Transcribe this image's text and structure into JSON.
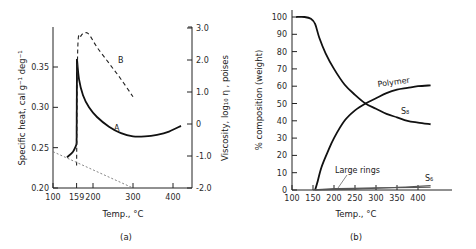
{
  "chart_data": [
    {
      "id": "a",
      "type": "line",
      "panel_label": "(a)",
      "xlabel": "Temp., °C",
      "ylabel_left": "Specific heat,  cal g⁻¹ deg⁻¹",
      "ylabel_right": "Viscosity,  log₁₀ η , poises",
      "xlim": [
        100,
        420
      ],
      "x_ticks": [
        100,
        159,
        200,
        300,
        400
      ],
      "ylim_left": [
        0.2,
        0.39
      ],
      "y_ticks_left": [
        "0.20",
        "0.25",
        "0.30",
        "0.35"
      ],
      "ylim_right": [
        -2.0,
        3.0
      ],
      "y_ticks_right": [
        "3.0",
        "2.0",
        "1.0",
        "0",
        "-1.0",
        "-2.0"
      ],
      "grid": false,
      "series": [
        {
          "name": "A",
          "axis": "left",
          "style": "solid",
          "label": "A",
          "x": [
            135,
            150,
            157,
            159,
            160,
            165,
            175,
            190,
            210,
            240,
            270,
            300,
            330,
            360,
            390,
            420
          ],
          "y": [
            0.238,
            0.245,
            0.252,
            0.255,
            0.36,
            0.335,
            0.315,
            0.3,
            0.288,
            0.276,
            0.268,
            0.264,
            0.264,
            0.266,
            0.27,
            0.277
          ]
        },
        {
          "name": "B",
          "axis": "right",
          "style": "dashed",
          "label": "B",
          "x": [
            159,
            162,
            170,
            180,
            190,
            210,
            240,
            270,
            300
          ],
          "y": [
            -1.3,
            2.4,
            2.75,
            2.85,
            2.8,
            2.4,
            1.9,
            1.4,
            0.85
          ]
        },
        {
          "name": "baseline",
          "axis": "left",
          "style": "dotted",
          "label": "",
          "x": [
            100,
            300
          ],
          "y": [
            0.245,
            0.2
          ]
        }
      ]
    },
    {
      "id": "b",
      "type": "line",
      "panel_label": "(b)",
      "xlabel": "Temp., °C",
      "ylabel": "% composition  (weight)",
      "xlim": [
        100,
        450
      ],
      "x_ticks": [
        100,
        150,
        200,
        250,
        300,
        350,
        400
      ],
      "ylim": [
        0,
        100
      ],
      "y_ticks": [
        0,
        10,
        20,
        30,
        40,
        50,
        60,
        70,
        80,
        90,
        100
      ],
      "grid": false,
      "series": [
        {
          "name": "S8",
          "label": "S₈",
          "x": [
            110,
            130,
            145,
            155,
            165,
            180,
            200,
            225,
            250,
            275,
            300,
            325,
            350,
            375,
            400,
            430
          ],
          "y": [
            100,
            100,
            99,
            96,
            88,
            79,
            70,
            61,
            55,
            50,
            47,
            44,
            42,
            40,
            39,
            38
          ]
        },
        {
          "name": "Polymer",
          "label": "Polymer",
          "x": [
            155,
            160,
            170,
            185,
            200,
            225,
            250,
            275,
            300,
            325,
            350,
            375,
            400,
            430
          ],
          "y": [
            0,
            4,
            13,
            22,
            30,
            40,
            46,
            50,
            53,
            56,
            58,
            59,
            60,
            60.5
          ]
        },
        {
          "name": "Large rings",
          "label": "Large rings",
          "x": [
            155,
            200,
            300,
            400,
            430
          ],
          "y": [
            0,
            0.8,
            1.2,
            1.5,
            1.6
          ]
        },
        {
          "name": "S6",
          "label": "S₆",
          "x": [
            150,
            250,
            350,
            430
          ],
          "y": [
            0,
            0.5,
            1.5,
            2.5
          ]
        }
      ]
    }
  ]
}
